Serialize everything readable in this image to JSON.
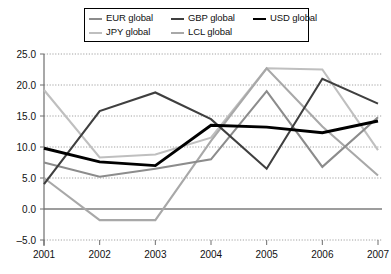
{
  "legend": {
    "items": [
      {
        "label": "EUR global",
        "color": "#8c8c8c",
        "width": 2.1,
        "key": "EUR"
      },
      {
        "label": "GBP global",
        "color": "#3f3f3f",
        "width": 2.1,
        "key": "GBP"
      },
      {
        "label": "USD global",
        "color": "#000000",
        "width": 2.9,
        "key": "USD"
      },
      {
        "label": "JPY global",
        "color": "#bfbfbf",
        "width": 2.1,
        "key": "JPY"
      },
      {
        "label": "LCL global",
        "color": "#a8a8a8",
        "width": 2.1,
        "key": "LCL"
      }
    ]
  },
  "chart_data": {
    "type": "line",
    "title": "",
    "xlabel": "",
    "ylabel": "",
    "categories": [
      "2001",
      "2002",
      "2003",
      "2004",
      "2005",
      "2006",
      "2007"
    ],
    "ylim": [
      -5.0,
      25.0
    ],
    "yticks": [
      -5.0,
      0.0,
      5.0,
      10.0,
      15.0,
      20.0,
      25.0
    ],
    "ytick_labels": [
      "-5.0",
      "0.0",
      "5.0",
      "10.0",
      "15.0",
      "20.0",
      "25.0"
    ],
    "xtick_labels": [
      "2001",
      "2002",
      "2003",
      "2004",
      "2005",
      "2006",
      "2007"
    ],
    "grid": true,
    "legend_position": "top",
    "series": [
      {
        "name": "EUR global",
        "color": "#8c8c8c",
        "width": 2.1,
        "values": [
          7.5,
          5.2,
          6.5,
          8.0,
          19.0,
          6.8,
          14.8
        ]
      },
      {
        "name": "GBP global",
        "color": "#3f3f3f",
        "width": 2.1,
        "values": [
          4.0,
          15.8,
          18.8,
          14.5,
          6.5,
          21.0,
          17.0
        ]
      },
      {
        "name": "USD global",
        "color": "#000000",
        "width": 2.9,
        "values": [
          9.8,
          7.6,
          7.0,
          13.5,
          13.2,
          12.3,
          14.2
        ]
      },
      {
        "name": "JPY global",
        "color": "#bfbfbf",
        "width": 2.1,
        "values": [
          19.2,
          8.3,
          8.8,
          11.5,
          22.7,
          22.5,
          9.5
        ]
      },
      {
        "name": "LCL global",
        "color": "#a8a8a8",
        "width": 2.1,
        "values": [
          5.0,
          -1.8,
          -1.8,
          11.0,
          22.7,
          13.3,
          5.4
        ]
      }
    ]
  }
}
